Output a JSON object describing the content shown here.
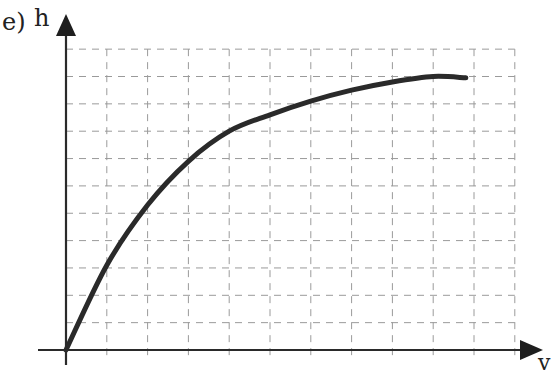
{
  "panel_label": "e)",
  "axes": {
    "y_label": "h",
    "x_label": "v",
    "grid": true,
    "grid_style": "dashed",
    "grid_columns": 11,
    "grid_rows": 11
  },
  "colors": {
    "curve": "#2a2a2a",
    "axis": "#2a2a2a",
    "grid": "#9a9a9a",
    "background": "#ffffff"
  },
  "chart_data": {
    "type": "line",
    "title": "",
    "xlabel": "v",
    "ylabel": "h",
    "xlim": [
      0,
      11
    ],
    "ylim": [
      0,
      11
    ],
    "grid": true,
    "ticks_labeled": false,
    "series": [
      {
        "name": "h(v)",
        "x": [
          0,
          1,
          2,
          3,
          4,
          5,
          6,
          7,
          8,
          9,
          9.8
        ],
        "y": [
          0,
          3.1,
          5.3,
          6.9,
          8.0,
          8.6,
          9.1,
          9.5,
          9.8,
          10.0,
          9.95
        ]
      }
    ]
  }
}
